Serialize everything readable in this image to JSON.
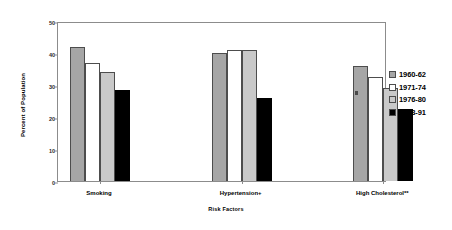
{
  "chart_data": {
    "type": "bar",
    "title": "",
    "xlabel": "Risk Factors",
    "ylabel": "Percent of Population",
    "ylim": [
      0,
      50
    ],
    "yticks": [
      0,
      10,
      20,
      30,
      40,
      50
    ],
    "ytick_labels": [
      "0",
      "10",
      "20",
      "30",
      "40",
      "50"
    ],
    "grid": false,
    "legend_position": "right",
    "categories": [
      "Smoking",
      "Hypertension+",
      "High Cholesterol**",
      "Overweight++"
    ],
    "series": [
      {
        "name": "1960-62",
        "color": "#a6a6a6",
        "values": [
          42,
          40,
          36,
          32
        ]
      },
      {
        "name": "1971-74",
        "color": "#ffffff",
        "values": [
          37,
          41,
          32.5,
          32
        ]
      },
      {
        "name": "1976-80",
        "color": "#c9c9c9",
        "values": [
          34,
          41,
          29,
          32.5
        ]
      },
      {
        "name": "1988-91",
        "color": "#000000",
        "values": [
          28.5,
          26,
          22.5,
          34.5
        ]
      }
    ]
  },
  "legend": {
    "items": [
      {
        "label": "1960-62"
      },
      {
        "label": "1971-74"
      },
      {
        "label": "1976-80"
      },
      {
        "label": "1988-91"
      }
    ]
  }
}
